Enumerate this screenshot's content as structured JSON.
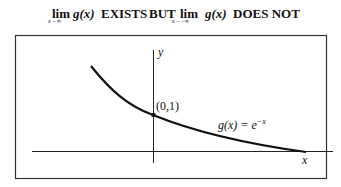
{
  "title": {
    "lim1": "lim",
    "func1": "g(x)",
    "sub1": "x→∞",
    "exists": "EXISTS",
    "but": "BUT",
    "lim2": "lim",
    "sub2": "x→−∞",
    "func2": "g(x)",
    "does_not": "DOES NOT"
  },
  "graph": {
    "y_axis_label": "y",
    "x_axis_label": "x",
    "point_label": "(0,1)",
    "function_label": "g(x) = e",
    "function_exponent": "−x"
  },
  "colors": {
    "ink": "#111111",
    "frame": "#333333",
    "background": "#ffffff"
  }
}
